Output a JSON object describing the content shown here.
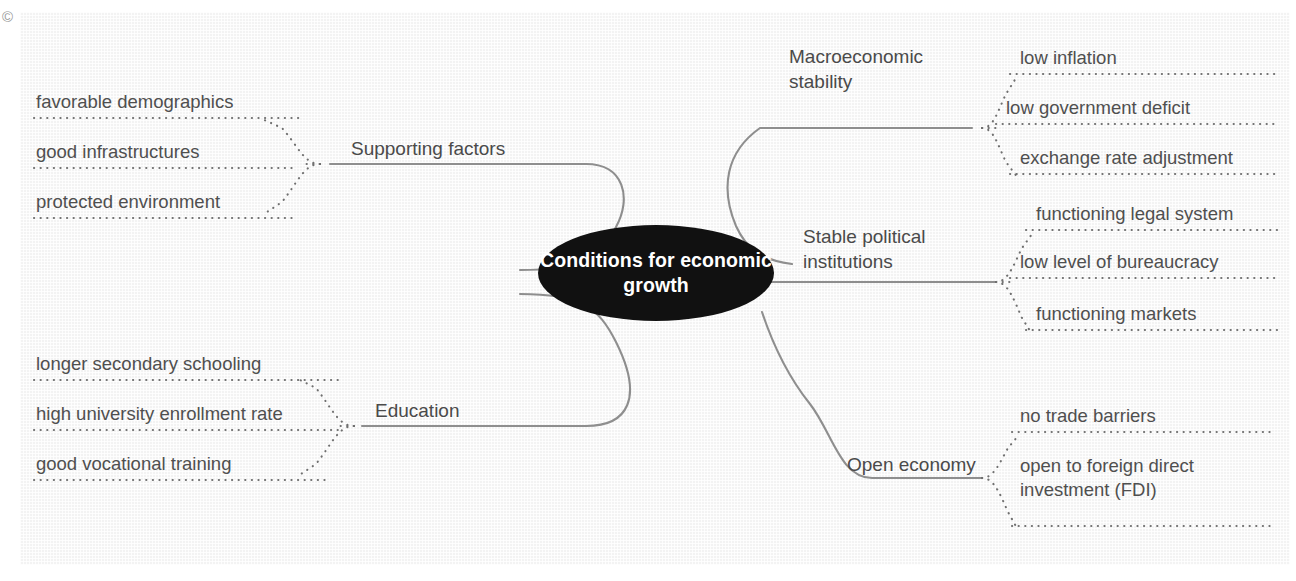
{
  "diagram": {
    "type": "mind-map",
    "copyright_symbol": "©",
    "hub": {
      "label": "Conditions for\neconomic growth",
      "fill": "#111111",
      "text_color": "#ffffff"
    },
    "colors": {
      "panel_background": "#f3f3f3",
      "branch_line": "#8e8e8e",
      "dotted_connector": "#6f6f6f",
      "text": "#4f4f4f"
    },
    "branches": [
      {
        "id": "supporting-factors",
        "label": "Supporting factors",
        "side": "left",
        "leaves": [
          "favorable demographics",
          "good infrastructures",
          "protected environment"
        ]
      },
      {
        "id": "education",
        "label": "Education",
        "side": "left",
        "leaves": [
          "longer secondary schooling",
          "high university enrollment rate",
          "good vocational training"
        ]
      },
      {
        "id": "macroeconomic-stability",
        "label": "Macroeconomic\nstability",
        "side": "right",
        "leaves": [
          "low inflation",
          "low government deficit",
          "exchange rate adjustment"
        ]
      },
      {
        "id": "stable-political-institutions",
        "label": "Stable political\ninstitutions",
        "side": "right",
        "leaves": [
          "functioning legal system",
          "low level of bureaucracy",
          "functioning markets"
        ]
      },
      {
        "id": "open-economy",
        "label": "Open economy",
        "side": "right",
        "leaves": [
          "no trade barriers",
          "open to foreign direct\ninvestment (FDI)"
        ]
      }
    ]
  }
}
